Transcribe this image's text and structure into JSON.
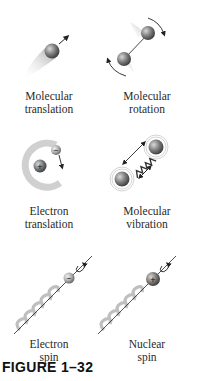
{
  "figure": {
    "caption": "FIGURE 1–32",
    "panels": [
      {
        "id": "molecular-translation",
        "line1": "Molecular",
        "line2": "translation"
      },
      {
        "id": "molecular-rotation",
        "line1": "Molecular",
        "line2": "rotation"
      },
      {
        "id": "electron-translation",
        "line1": "Electron",
        "line2": "translation"
      },
      {
        "id": "molecular-vibration",
        "line1": "Molecular",
        "line2": "vibration"
      },
      {
        "id": "electron-spin",
        "line1": "Electron",
        "line2": "spin"
      },
      {
        "id": "nuclear-spin",
        "line1": "Nuclear",
        "line2": "spin"
      }
    ],
    "symbols": {
      "plus": "+",
      "minus": "−"
    }
  }
}
